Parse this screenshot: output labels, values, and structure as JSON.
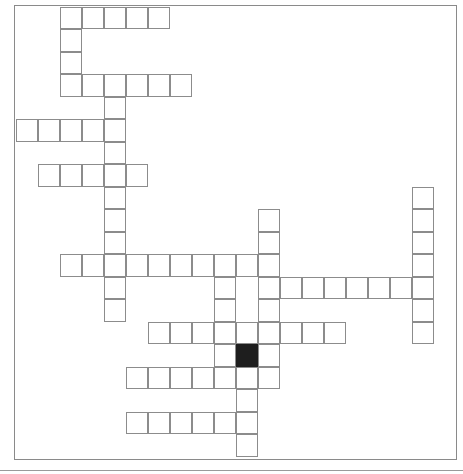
{
  "puzzle": {
    "type": "crossword",
    "grid": {
      "origin_x": 16,
      "origin_y": 7,
      "cell_w": 22,
      "cell_h": 22.5
    },
    "colors": {
      "cell_border": "#8c8c8c",
      "block_fill": "#1e1e1e",
      "background": "#ffffff"
    },
    "entries": [
      {
        "dir": "across",
        "row": 0,
        "col": 2,
        "length": 5
      },
      {
        "dir": "down",
        "row": 0,
        "col": 2,
        "length": 4
      },
      {
        "dir": "across",
        "row": 3,
        "col": 2,
        "length": 6
      },
      {
        "dir": "down",
        "row": 3,
        "col": 4,
        "length": 11
      },
      {
        "dir": "across",
        "row": 5,
        "col": 0,
        "length": 5
      },
      {
        "dir": "across",
        "row": 7,
        "col": 1,
        "length": 5
      },
      {
        "dir": "across",
        "row": 11,
        "col": 2,
        "length": 10
      },
      {
        "dir": "down",
        "row": 11,
        "col": 9,
        "length": 6
      },
      {
        "dir": "down",
        "row": 9,
        "col": 11,
        "length": 8
      },
      {
        "dir": "across",
        "row": 12,
        "col": 11,
        "length": 8
      },
      {
        "dir": "down",
        "row": 8,
        "col": 18,
        "length": 7
      },
      {
        "dir": "across",
        "row": 14,
        "col": 6,
        "length": 9
      },
      {
        "dir": "down",
        "row": 15,
        "col": 10,
        "length": 5
      },
      {
        "dir": "across",
        "row": 16,
        "col": 5,
        "length": 7
      },
      {
        "dir": "across",
        "row": 18,
        "col": 5,
        "length": 6
      }
    ],
    "blocks": [
      {
        "row": 15,
        "col": 10
      }
    ]
  }
}
